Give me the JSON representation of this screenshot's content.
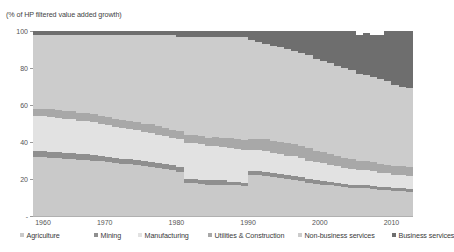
{
  "chart_title": "(% of HP filtered value added growth)",
  "axes": {
    "y_ticks": [
      {
        "label": "100",
        "value": 100
      },
      {
        "label": "80",
        "value": 80
      },
      {
        "label": "60",
        "value": 60
      },
      {
        "label": "40",
        "value": 40
      },
      {
        "label": "20",
        "value": 20
      },
      {
        "label": "-",
        "value": 0
      }
    ],
    "x_ticks": [
      {
        "label": "1960",
        "value": 1960
      },
      {
        "label": "1970",
        "value": 1970
      },
      {
        "label": "1980",
        "value": 1980
      },
      {
        "label": "1990",
        "value": 1990
      },
      {
        "label": "2000",
        "value": 2000
      },
      {
        "label": "2010",
        "value": 2010
      }
    ]
  },
  "legend": {
    "items": [
      {
        "label": "Agriculture",
        "color": "#c9c9c9",
        "left": 0
      },
      {
        "label": "Mining",
        "color": "#8f8f8f",
        "left": 74
      },
      {
        "label": "Manufacturing",
        "color": "#e2e2e2",
        "left": 118
      },
      {
        "label": "Utilities & Construction",
        "color": "#a8a8a8",
        "left": 188
      },
      {
        "label": "Non-business services",
        "color": "#cccccc",
        "left": 278
      },
      {
        "label": "Business services",
        "color": "#6e6e6e",
        "left": 372
      }
    ]
  },
  "chart_data": {
    "type": "area",
    "title": "(% of HP filtered value added growth)",
    "subtitle": "",
    "xlabel": "",
    "ylabel": "",
    "stacked": true,
    "stack_order_bottom_to_top": [
      "Agriculture",
      "Mining",
      "Manufacturing",
      "Utilities & Construction",
      "Non-business services",
      "Business services"
    ],
    "xlim": [
      1960,
      2013
    ],
    "ylim": [
      0,
      100
    ],
    "grid": false,
    "legend_position": "bottom",
    "x": [
      1960,
      1961,
      1962,
      1963,
      1964,
      1965,
      1966,
      1967,
      1968,
      1969,
      1970,
      1971,
      1972,
      1973,
      1974,
      1975,
      1976,
      1977,
      1978,
      1979,
      1980,
      1981,
      1982,
      1983,
      1984,
      1985,
      1986,
      1987,
      1988,
      1989,
      1990,
      1991,
      1992,
      1993,
      1994,
      1995,
      1996,
      1997,
      1998,
      1999,
      2000,
      2001,
      2002,
      2003,
      2004,
      2005,
      2006,
      2007,
      2008,
      2009,
      2010,
      2011,
      2012,
      2013
    ],
    "series": [
      {
        "name": "Agriculture",
        "color": "#c9c9c9",
        "values": [
          32,
          32,
          31.5,
          31.5,
          31,
          31,
          30.5,
          30.5,
          30,
          29.5,
          29,
          28.5,
          28,
          28,
          27.5,
          27,
          26.5,
          26,
          25.5,
          25,
          24,
          18,
          18,
          17.5,
          17,
          17,
          17,
          16.5,
          16.5,
          16,
          22,
          22,
          21.5,
          21,
          20.5,
          20,
          19.5,
          19,
          18,
          17.5,
          17,
          16.5,
          16,
          15.5,
          15,
          15,
          15,
          14.5,
          14,
          14,
          13.5,
          13.5,
          13,
          13
        ]
      },
      {
        "name": "Mining",
        "color": "#8f8f8f",
        "values": [
          3,
          3,
          3,
          3,
          3,
          3,
          3,
          2.8,
          2.8,
          2.8,
          2.8,
          2.6,
          2.6,
          2.6,
          2.6,
          2.5,
          2.5,
          2.5,
          2.5,
          2.4,
          2.4,
          2.2,
          2.2,
          2.2,
          2.2,
          2.2,
          2.2,
          2,
          2,
          2,
          2.2,
          2.2,
          2.2,
          2.2,
          2.2,
          2.2,
          2.2,
          2.2,
          2,
          2,
          2,
          2,
          2,
          2,
          2,
          1.8,
          1.8,
          1.8,
          1.8,
          1.8,
          1.8,
          1.8,
          1.8,
          1.8
        ]
      },
      {
        "name": "Manufacturing",
        "color": "#e2e2e2",
        "values": [
          19,
          19,
          19,
          18.5,
          18.5,
          18.5,
          18,
          18,
          18,
          17.5,
          17.5,
          17,
          17,
          16.5,
          16.5,
          16,
          16,
          15.5,
          15.5,
          15,
          15,
          19,
          19,
          19,
          18.5,
          18.5,
          18,
          18,
          17.5,
          17.5,
          11.5,
          11.5,
          11.5,
          11,
          11,
          10.5,
          10.5,
          10,
          10,
          9.5,
          9.5,
          9,
          9,
          8.5,
          8.5,
          8,
          8,
          8,
          7.5,
          7.5,
          7,
          7,
          7,
          7
        ]
      },
      {
        "name": "Utilities & Construction",
        "color": "#a8a8a8",
        "values": [
          4,
          4,
          4.5,
          4.5,
          4.5,
          4,
          4,
          4.5,
          4.5,
          4,
          4,
          4.5,
          4.5,
          4,
          4,
          4,
          4.5,
          4.5,
          4,
          4,
          4.5,
          4.5,
          4.5,
          4.5,
          4.5,
          5,
          5,
          5.5,
          5.5,
          5.5,
          6,
          6,
          6.5,
          6.5,
          6.5,
          6.5,
          6.5,
          6.5,
          6.5,
          6,
          6,
          6,
          5.5,
          5.5,
          5.5,
          5,
          5,
          5,
          5,
          4.5,
          4.5,
          4.5,
          4.5,
          4.5
        ]
      },
      {
        "name": "Non-business services",
        "color": "#cccccc",
        "values": [
          40,
          40,
          40,
          40.5,
          41,
          41.5,
          42.5,
          42.2,
          42.7,
          44.2,
          44.7,
          45.4,
          45.9,
          46.9,
          47.4,
          48.5,
          48.5,
          49.5,
          50.5,
          51.6,
          51.1,
          53.3,
          53.3,
          53.8,
          54.8,
          54.3,
          54.8,
          55,
          55.5,
          56,
          53.3,
          52.3,
          51.3,
          51.3,
          51.3,
          51.3,
          50.3,
          50.3,
          50.5,
          50,
          49.5,
          49,
          48.5,
          48.5,
          48,
          47.2,
          46.2,
          45.7,
          45.7,
          45.2,
          44.2,
          43.2,
          42.7,
          42.2
        ]
      },
      {
        "name": "Business services",
        "color": "#6e6e6e",
        "values": [
          2,
          2,
          2,
          2,
          2,
          2,
          2,
          2,
          2,
          2,
          2,
          2,
          2,
          2,
          2,
          2,
          2,
          2,
          2,
          2,
          3,
          3,
          3,
          3,
          3,
          3,
          3,
          3,
          3,
          3,
          5,
          6,
          7,
          8,
          8.5,
          9.5,
          11,
          12,
          13,
          15,
          16,
          17.5,
          20.5,
          20,
          22,
          21,
          23,
          23,
          24,
          27,
          29,
          30,
          31,
          32
        ]
      }
    ]
  }
}
